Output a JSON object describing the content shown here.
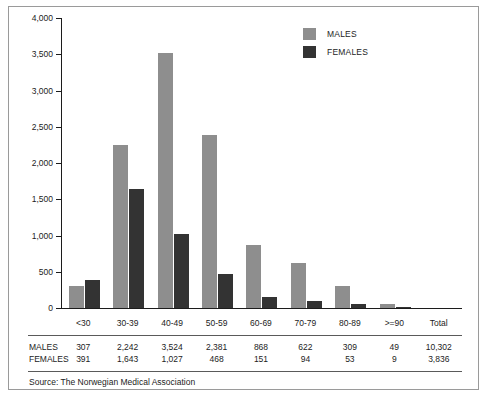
{
  "chart_data": {
    "type": "bar",
    "title": "",
    "subtitle": "",
    "xlabel": "",
    "ylabel": "",
    "ylim": [
      0,
      4000
    ],
    "ytick_step": 500,
    "grid": false,
    "legend_position": "top-right",
    "categories": [
      "<30",
      "30-39",
      "40-49",
      "50-59",
      "60-69",
      "70-79",
      "80-89",
      ">=90",
      "Total"
    ],
    "ytick_labels": [
      "4,000",
      "3,500",
      "3,000",
      "2,500",
      "2,000",
      "1,500",
      "1,000",
      "500",
      "0"
    ],
    "ytick_values": [
      4000,
      3500,
      3000,
      2500,
      2000,
      1500,
      1000,
      500,
      0
    ],
    "series": [
      {
        "name": "MALES",
        "color": "#8e8e8e",
        "values": [
          307,
          2242,
          3524,
          2381,
          868,
          622,
          309,
          49,
          10302
        ],
        "value_labels": [
          "307",
          "2,242",
          "3,524",
          "2,381",
          "868",
          "622",
          "309",
          "49",
          "10,302"
        ],
        "plotted": [
          true,
          true,
          true,
          true,
          true,
          true,
          true,
          true,
          false
        ]
      },
      {
        "name": "FEMALES",
        "color": "#333333",
        "values": [
          391,
          1643,
          1027,
          468,
          151,
          94,
          53,
          9,
          3836
        ],
        "value_labels": [
          "391",
          "1,643",
          "1,027",
          "468",
          "151",
          "94",
          "53",
          "9",
          "3,836"
        ],
        "plotted": [
          true,
          true,
          true,
          true,
          true,
          true,
          true,
          true,
          false
        ]
      }
    ],
    "annotations": [
      "Source: The Norwegian Medical Association"
    ]
  },
  "legend": {
    "items": [
      {
        "label": "MALES",
        "color": "#8e8e8e"
      },
      {
        "label": "FEMALES",
        "color": "#333333"
      }
    ]
  },
  "table": {
    "row_labels": [
      "MALES",
      "FEMALES"
    ]
  },
  "source": {
    "text": "Source: The Norwegian Medical Association"
  },
  "colors": {
    "males": "#8e8e8e",
    "females": "#333333",
    "axis": "#1c1c1c",
    "border": "#9a9a9a",
    "background": "#ffffff"
  }
}
